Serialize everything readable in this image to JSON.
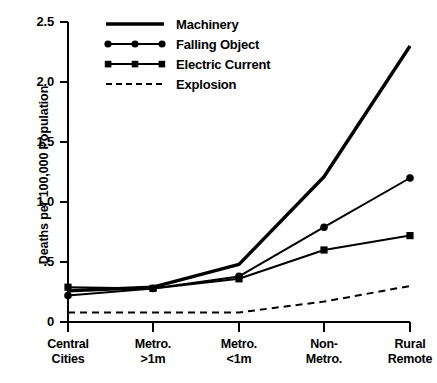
{
  "chart_data": {
    "type": "line",
    "title": "",
    "xlabel": "",
    "ylabel": "Deaths per 100,000 Population",
    "categories": [
      "Central Cities",
      "Metro. >1m",
      "Metro. <1m",
      "Non- Metro.",
      "Rural Remote"
    ],
    "category_lines": [
      [
        "Central",
        "Cities"
      ],
      [
        "Metro.",
        ">1m"
      ],
      [
        "Metro.",
        "<1m"
      ],
      [
        "Non-",
        "Metro."
      ],
      [
        "Rural",
        "Remote"
      ]
    ],
    "ylim": [
      0,
      2.5
    ],
    "ytick_labels": [
      "2.5",
      "2.0",
      "1.5",
      "1.0",
      ".5",
      "0"
    ],
    "ytick_values": [
      2.5,
      2.0,
      1.5,
      1.0,
      0.5,
      0
    ],
    "grid": false,
    "legend_position": "top-center",
    "series": [
      {
        "name": "Machinery",
        "style": "solid-thick",
        "marker": "none",
        "color": "#000000",
        "values": [
          0.26,
          0.29,
          0.48,
          1.21,
          2.3
        ]
      },
      {
        "name": "Falling Object",
        "style": "solid",
        "marker": "circle",
        "color": "#000000",
        "values": [
          0.22,
          0.28,
          0.38,
          0.79,
          1.2
        ]
      },
      {
        "name": "Electric Current",
        "style": "solid",
        "marker": "square",
        "color": "#000000",
        "values": [
          0.29,
          0.28,
          0.36,
          0.6,
          0.72
        ]
      },
      {
        "name": "Explosion",
        "style": "dashed",
        "marker": "none",
        "color": "#000000",
        "values": [
          0.08,
          0.08,
          0.08,
          0.17,
          0.3
        ]
      }
    ]
  },
  "axes": {
    "y_title": "Deaths per 100,000 Population"
  },
  "legend": {
    "items": [
      {
        "label": "Machinery"
      },
      {
        "label": "Falling Object"
      },
      {
        "label": "Electric Current"
      },
      {
        "label": "Explosion"
      }
    ]
  }
}
